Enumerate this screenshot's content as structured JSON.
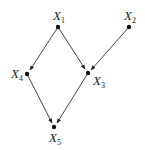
{
  "diagram": {
    "type": "directed-acyclic-graph",
    "nodes": [
      {
        "id": "X1",
        "label": "X",
        "sub": "1",
        "x": 58,
        "y": 27
      },
      {
        "id": "X2",
        "label": "X",
        "sub": "2",
        "x": 129,
        "y": 27
      },
      {
        "id": "X3",
        "label": "X",
        "sub": "3",
        "x": 88,
        "y": 73
      },
      {
        "id": "X4",
        "label": "X",
        "sub": "4",
        "x": 27,
        "y": 74
      },
      {
        "id": "X5",
        "label": "X",
        "sub": "5",
        "x": 54,
        "y": 127
      }
    ],
    "edges": [
      {
        "from": "X1",
        "to": "X4"
      },
      {
        "from": "X1",
        "to": "X3"
      },
      {
        "from": "X2",
        "to": "X3"
      },
      {
        "from": "X4",
        "to": "X5"
      },
      {
        "from": "X3",
        "to": "X5"
      }
    ],
    "colors": {
      "edge": "#333333",
      "node": "#111111",
      "text": "#222222"
    }
  }
}
